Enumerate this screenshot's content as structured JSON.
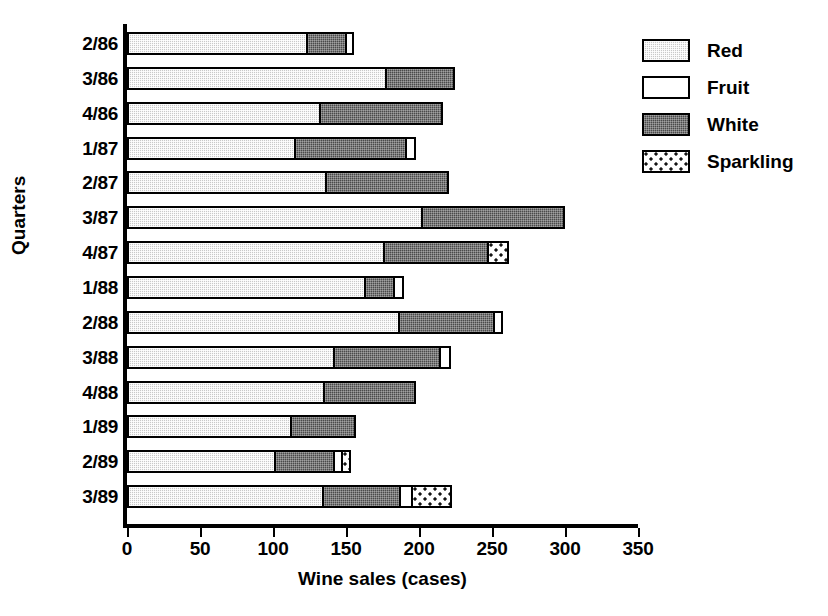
{
  "chart_data": {
    "type": "bar",
    "orientation": "horizontal",
    "stacked": true,
    "title": "",
    "xlabel": "Wine sales (cases)",
    "ylabel": "Quarters",
    "xlim": [
      0,
      350
    ],
    "xticks": [
      0,
      50,
      100,
      150,
      200,
      250,
      300,
      350
    ],
    "xtick_labels": [
      "0",
      "50",
      "100",
      "150",
      "200",
      "250",
      "300",
      "350"
    ],
    "grid": false,
    "legend_position": "right",
    "categories": [
      "2/86",
      "3/86",
      "4/86",
      "1/87",
      "2/87",
      "3/87",
      "4/87",
      "1/88",
      "2/88",
      "3/88",
      "4/88",
      "1/89",
      "2/89",
      "3/89"
    ],
    "series": [
      {
        "name": "Red",
        "values": [
          121,
          175,
          130,
          113,
          134,
          200,
          174,
          161,
          184,
          140,
          133,
          110,
          99,
          132
        ]
      },
      {
        "name": "White",
        "values": [
          27,
          47,
          84,
          76,
          84,
          97,
          71,
          20,
          65,
          72,
          62,
          44,
          41,
          53
        ]
      },
      {
        "name": "Fruit",
        "values": [
          5,
          0,
          0,
          6,
          0,
          0,
          0,
          6,
          6,
          7,
          0,
          0,
          5,
          8
        ]
      },
      {
        "name": "Sparkling",
        "values": [
          0,
          0,
          0,
          0,
          0,
          0,
          14,
          0,
          0,
          0,
          0,
          0,
          6,
          27
        ]
      }
    ],
    "segment_order": [
      "Red",
      "White",
      "Fruit",
      "Sparkling"
    ],
    "totals": [
      153,
      222,
      214,
      195,
      218,
      297,
      259,
      187,
      255,
      219,
      195,
      154,
      151,
      220
    ]
  },
  "legend": {
    "items": [
      {
        "label": "Red",
        "pattern": "light-stipple",
        "color": "#c9c9c9"
      },
      {
        "label": "Fruit",
        "pattern": "empty",
        "color": "#ffffff"
      },
      {
        "label": "White",
        "pattern": "dark-stipple",
        "color": "#4a4a4a"
      },
      {
        "label": "Sparkling",
        "pattern": "sparse-dots",
        "color": "#ffffff"
      }
    ]
  },
  "axes": {
    "x_title": "Wine sales (cases)",
    "y_title": "Quarters"
  }
}
